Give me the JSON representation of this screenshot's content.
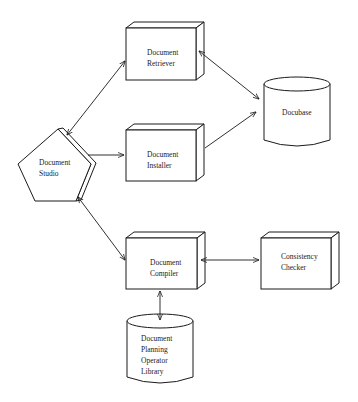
{
  "diagram": {
    "nodes": {
      "retriever": {
        "shape": "3d-box",
        "lines": [
          "Document",
          "Retriever"
        ]
      },
      "docubase": {
        "shape": "cylinder",
        "lines": [
          "Docubase"
        ]
      },
      "installer": {
        "shape": "3d-box",
        "lines": [
          "Document",
          "Installer"
        ]
      },
      "studio": {
        "shape": "3d-pentagon",
        "lines": [
          "Document",
          "Studio"
        ]
      },
      "compiler": {
        "shape": "3d-box",
        "lines": [
          "Document",
          "Compiler"
        ]
      },
      "checker": {
        "shape": "3d-box",
        "lines": [
          "Consistency",
          "Checker"
        ]
      },
      "library": {
        "shape": "cylinder",
        "lines": [
          "Document",
          "Planning",
          "Operator",
          "Library"
        ]
      }
    },
    "edges": [
      {
        "from": "Document Studio",
        "to": "Document Retriever",
        "direction": "bidirectional"
      },
      {
        "from": "Document Retriever",
        "to": "Docubase",
        "direction": "bidirectional"
      },
      {
        "from": "Document Studio",
        "to": "Document Installer",
        "direction": "forward"
      },
      {
        "from": "Document Installer",
        "to": "Docubase",
        "direction": "forward"
      },
      {
        "from": "Document Studio",
        "to": "Document Compiler",
        "direction": "bidirectional"
      },
      {
        "from": "Document Compiler",
        "to": "Consistency Checker",
        "direction": "bidirectional"
      },
      {
        "from": "Document Compiler",
        "to": "Document Planning Operator Library",
        "direction": "bidirectional"
      }
    ],
    "colors": {
      "stroke": "#1a1a1a",
      "fill": "#ffffff",
      "background": "#ffffff"
    }
  }
}
